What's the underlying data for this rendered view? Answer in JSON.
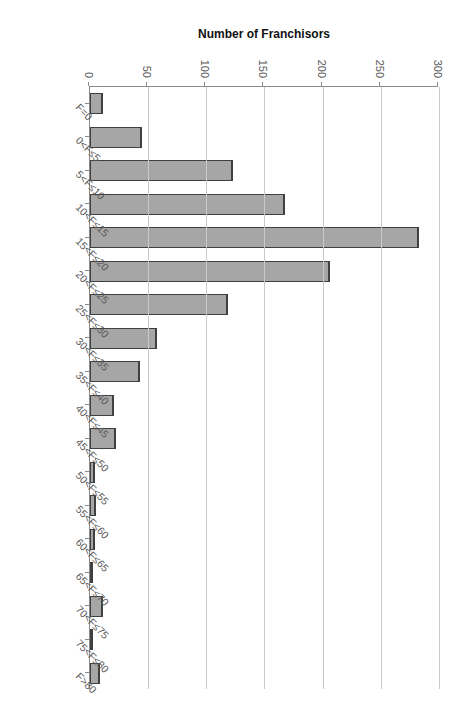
{
  "chart_data": {
    "type": "bar",
    "title": "",
    "xlabel": "Franchise Fee, F, in $ thousands",
    "ylabel": "Number of Franchisors",
    "orientation": "vertical-rendered-rotated-90cw",
    "grid": true,
    "legend": null,
    "ylim": [
      0,
      300
    ],
    "yticks": [
      0,
      50,
      100,
      150,
      200,
      250,
      300
    ],
    "ytick_labels": [
      "0",
      "50",
      "100",
      "150",
      "200",
      "250",
      "300"
    ],
    "categories": [
      "F=0",
      "0<F≤5",
      "5<F≤10",
      "10<F≤15",
      "15<F≤20",
      "20<F≤25",
      "25<F≤30",
      "30<F≤35",
      "35<F≤40",
      "40<F≤45",
      "45<F≤50",
      "50<F≤55",
      "55<F≤60",
      "60<F≤65",
      "65<F≤70",
      "70<F≤75",
      "75<F≤80",
      "F>80"
    ],
    "values": [
      11,
      45,
      123,
      168,
      283,
      206,
      119,
      58,
      43,
      21,
      22,
      4,
      5,
      4,
      2,
      11,
      3,
      9
    ],
    "bar_fill_color": "#a6a6a6",
    "bar_border_color": "#404040",
    "grid_color": "#c9c9c9",
    "axis_color": "#8a8a8a"
  }
}
